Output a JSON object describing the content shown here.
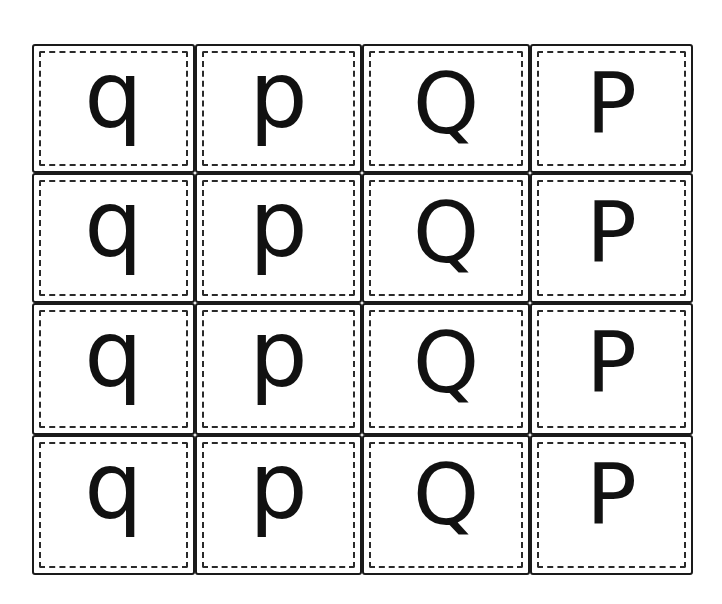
{
  "worksheet": {
    "type": "letter-quilt",
    "columns": 4,
    "rows": 4,
    "grid": [
      [
        "q",
        "p",
        "Q",
        "P"
      ],
      [
        "q",
        "p",
        "Q",
        "P"
      ],
      [
        "q",
        "p",
        "Q",
        "P"
      ],
      [
        "q",
        "p",
        "Q",
        "P"
      ]
    ],
    "colors": {
      "line": "#1a1a1a",
      "background": "#ffffff",
      "letter": "#111111"
    }
  }
}
